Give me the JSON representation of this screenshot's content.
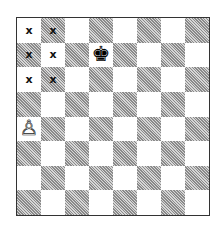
{
  "board": {
    "orientation": "white-bottom",
    "files": [
      "a",
      "b",
      "c",
      "d",
      "e",
      "f",
      "g",
      "h"
    ],
    "ranks": [
      8,
      7,
      6,
      5,
      4,
      3,
      2,
      1
    ],
    "light_color": "#ffffff",
    "dark_color": "#bdbdbd",
    "pieces": [
      {
        "square": "d7",
        "color": "black",
        "type": "king",
        "glyph": "♚"
      },
      {
        "square": "a4",
        "color": "white",
        "type": "pawn",
        "glyph": "♙"
      }
    ],
    "marks": [
      {
        "square": "a8",
        "label": "x"
      },
      {
        "square": "b8",
        "label": "x"
      },
      {
        "square": "a7",
        "label": "x"
      },
      {
        "square": "b7",
        "label": "x"
      },
      {
        "square": "a6",
        "label": "x"
      },
      {
        "square": "b6",
        "label": "x"
      }
    ]
  }
}
